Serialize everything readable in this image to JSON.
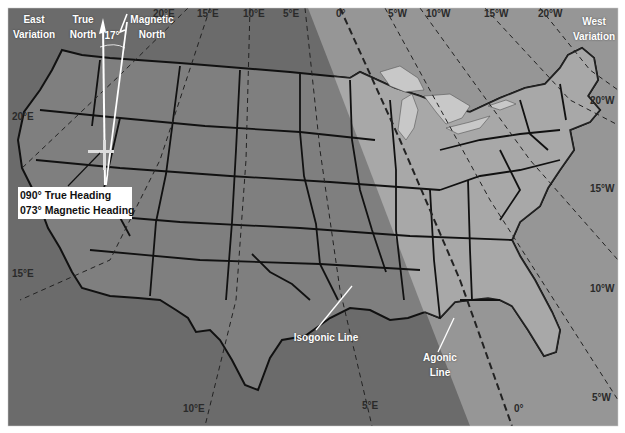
{
  "colors": {
    "ocean_east_variation": "#6b6b6b",
    "ocean_west_variation": "#999999",
    "land_east": "#7d7d7d",
    "land_west": "#aaaaaa",
    "lakes": "#c9c9c9",
    "state_borders": "#111111",
    "isogonic_lines": "#2a2a2a",
    "label_text": "#ffffff"
  },
  "corner_labels": {
    "east_variation": [
      "East",
      "Variation"
    ],
    "west_variation": [
      "West",
      "Variation"
    ]
  },
  "north_indicator": {
    "true_north": [
      "True",
      "North"
    ],
    "magnetic_north": [
      "Magnetic",
      "North"
    ],
    "angle": "17°"
  },
  "heading_callout": {
    "true_heading": "090° True Heading",
    "magnetic_heading": "073° Magnetic Heading"
  },
  "isogonic_top_labels": [
    "20°E",
    "15°E",
    "10°E",
    "5°E",
    "0°",
    "5°W",
    "10°W",
    "15°W",
    "20°W"
  ],
  "isogonic_left_labels": [
    "20°E",
    "15°E"
  ],
  "isogonic_right_labels": [
    "20°W",
    "15°W",
    "10°W",
    "5°W"
  ],
  "isogonic_bottom_labels": [
    "10°E",
    "5°E",
    "0°"
  ],
  "callouts": {
    "isogonic_line": "Isogonic Line",
    "agonic_line": [
      "Agonic",
      "Line"
    ]
  }
}
